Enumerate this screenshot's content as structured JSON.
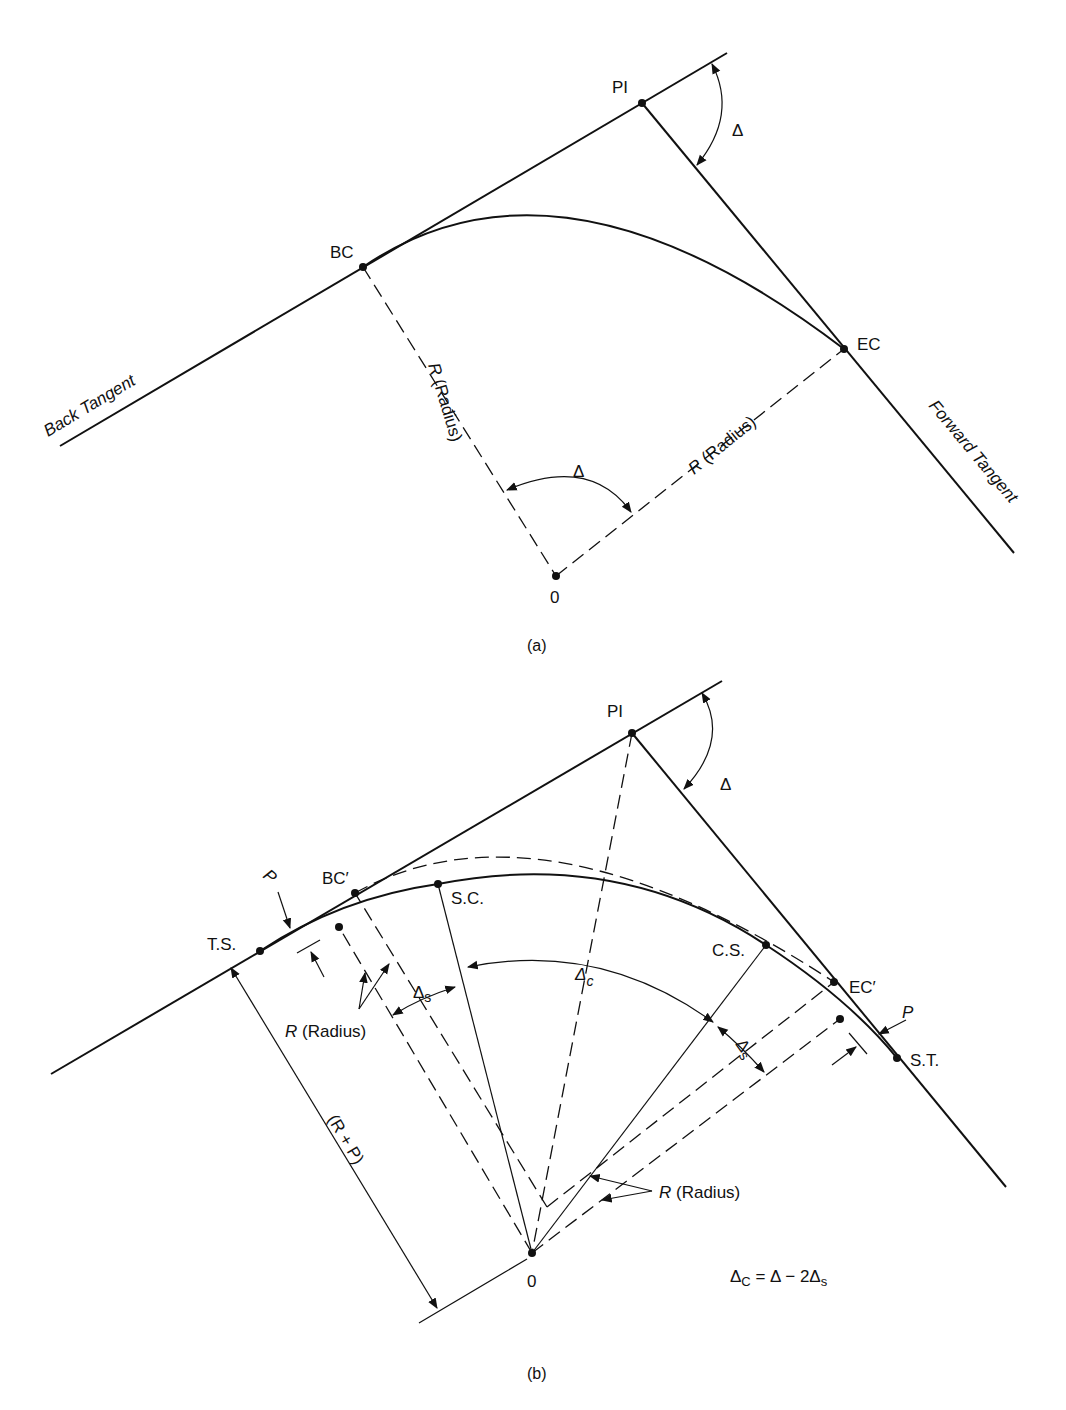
{
  "figure_a": {
    "caption": "(a)",
    "labels": {
      "pi": "PI",
      "bc": "BC",
      "ec": "EC",
      "o": "0",
      "delta_top": "Δ",
      "delta_center": "Δ",
      "back_tangent": "Back Tangent",
      "forward_tangent": "Forward Tangent",
      "radius_left_r": "R",
      "radius_left_text": " (Radius)",
      "radius_right_r": "R",
      "radius_right_text": " (Radius)"
    }
  },
  "figure_b": {
    "caption": "(b)",
    "labels": {
      "pi": "PI",
      "bc_prime": "BC′",
      "ec_prime": "EC′",
      "ts": "T.S.",
      "sc": "S.C.",
      "cs": "C.S.",
      "st": "S.T.",
      "o": "0",
      "delta_top": "Δ",
      "p_left": "P",
      "p_right": "P",
      "delta_c": "Δ",
      "delta_c_sub": "c",
      "delta_s_left": "Δ",
      "delta_s_left_sub": "s",
      "delta_s_right": "Δ",
      "delta_s_right_sub": "s",
      "radius_left_r": "R",
      "radius_left_text": " (Radius)",
      "radius_right_r": "R",
      "radius_right_text": " (Radius)",
      "r_plus_p": "(R + P)",
      "formula": {
        "lhs": "Δ",
        "lhs_sub": "C",
        "rhs": " = Δ − 2Δ",
        "rhs_sub": "s"
      }
    }
  }
}
